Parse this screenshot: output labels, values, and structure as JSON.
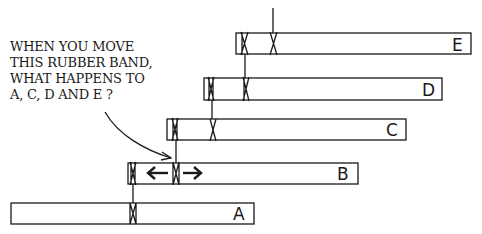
{
  "question": {
    "lines": [
      "WHEN YOU MOVE",
      "THIS RUBBER BAND,",
      "WHAT HAPPENS TO",
      "A, C, D AND E ?"
    ]
  },
  "bars": [
    {
      "id": "A",
      "label": "A",
      "x": 11,
      "y": 203,
      "w": 243,
      "h": 21
    },
    {
      "id": "B",
      "label": "B",
      "x": 128,
      "y": 163,
      "w": 230,
      "h": 21
    },
    {
      "id": "C",
      "label": "C",
      "x": 167,
      "y": 119,
      "w": 239,
      "h": 21
    },
    {
      "id": "D",
      "label": "D",
      "x": 204,
      "y": 78,
      "w": 238,
      "h": 22
    },
    {
      "id": "E",
      "label": "E",
      "x": 236,
      "y": 33,
      "w": 235,
      "h": 21
    }
  ],
  "rubber_bands": [
    {
      "on": "A",
      "x": 133
    },
    {
      "on": "B",
      "x": 133
    },
    {
      "on": "B",
      "x": 176,
      "highlighted": true
    },
    {
      "on": "C",
      "x": 176
    },
    {
      "on": "C",
      "x": 213
    },
    {
      "on": "D",
      "x": 211
    },
    {
      "on": "D",
      "x": 246
    },
    {
      "on": "E",
      "x": 244
    },
    {
      "on": "E",
      "x": 273
    }
  ],
  "arrows": {
    "left": "←",
    "right": "→"
  },
  "colors": {
    "ink": "#1a1a1a",
    "background": "#ffffff"
  }
}
